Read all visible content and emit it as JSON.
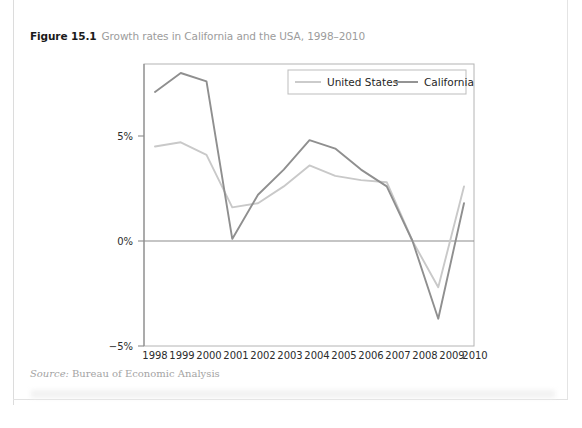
{
  "figure": {
    "number": "Figure 15.1",
    "title": "Growth rates in California and the USA, 1998–2010",
    "source_word": "Source:",
    "source_body": "Bureau of Economic Analysis"
  },
  "colors": {
    "united_states_line": "#c9c9c9",
    "california_line": "#8f8f8f",
    "axis": "#8c8c8c",
    "plot_border": "#b4b4b4",
    "zero_line": "#8c8c8c",
    "caption_title": "#9c9c9c",
    "caption_number": "#1a1a1a",
    "source_text": "#a4a4a4"
  },
  "chart_data": {
    "type": "line",
    "title": "Growth rates in California and the USA, 1998–2010",
    "xlabel": "",
    "ylabel": "",
    "grid": false,
    "legend_position": "top-right",
    "xlim": [
      1998,
      2010
    ],
    "ylim": [
      -5,
      9
    ],
    "ytick_labels": [
      "5%",
      "0%",
      "−5%"
    ],
    "ytick_values": [
      5,
      0,
      -5
    ],
    "categories": [
      "1998",
      "1999",
      "2000",
      "2001",
      "2002",
      "2003",
      "2004",
      "2005",
      "2006",
      "2007",
      "2008",
      "2009",
      "2010"
    ],
    "x": [
      1998,
      1999,
      2000,
      2001,
      2002,
      2003,
      2004,
      2005,
      2006,
      2007,
      2008,
      2009,
      2010
    ],
    "series": [
      {
        "name": "United States",
        "color": "#c9c9c9",
        "values": [
          4.5,
          4.7,
          4.1,
          1.6,
          1.8,
          2.6,
          3.6,
          3.1,
          2.9,
          2.8,
          0.0,
          -2.2,
          2.6
        ]
      },
      {
        "name": "California",
        "color": "#8f8f8f",
        "values": [
          7.1,
          8.0,
          7.6,
          0.1,
          2.2,
          3.4,
          4.8,
          4.4,
          3.4,
          2.6,
          0.0,
          -3.7,
          1.8
        ]
      }
    ]
  },
  "legend": {
    "items": [
      {
        "label": "United States",
        "color": "#c9c9c9"
      },
      {
        "label": "California",
        "color": "#8f8f8f"
      }
    ]
  }
}
